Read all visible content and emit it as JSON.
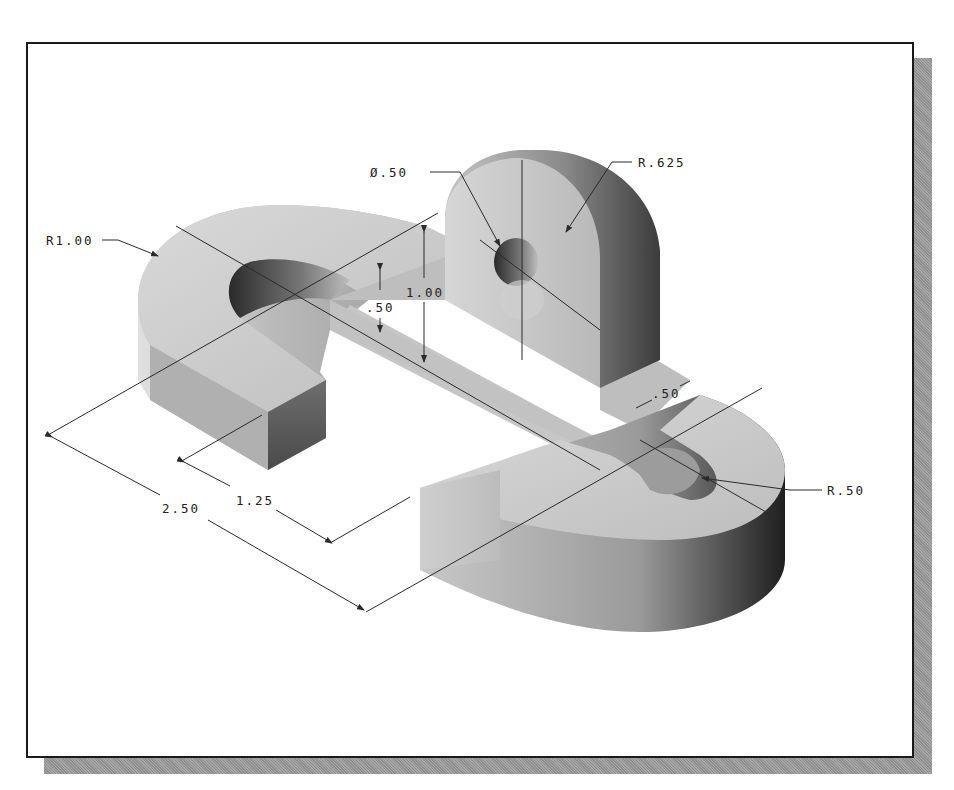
{
  "drawing": {
    "title": "Isometric view of bracket part with dimensions",
    "dimensions": {
      "hole_diameter": "Ø.50",
      "boss_radius": "R.625",
      "outer_radius_left": "R1.00",
      "outer_radius_right": "R.50",
      "height_total": "1.00",
      "base_thickness": ".50",
      "boss_width": ".50",
      "slot_length": "1.25",
      "overall_length": "2.50"
    }
  },
  "colors": {
    "frame_border": "#1a1a1a",
    "shadow": "#9a9a9a",
    "part_top": "#c8c8c8",
    "part_side_light": "#b5b5b5",
    "part_side_dark": "#3a3a3a",
    "dimension_line": "#2a2a2a"
  }
}
